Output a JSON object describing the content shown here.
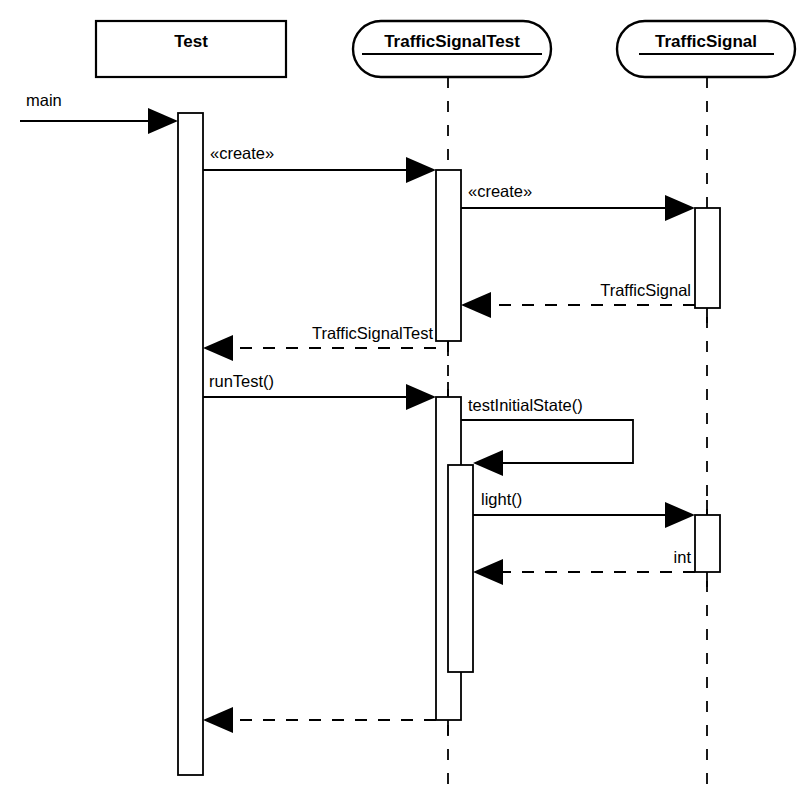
{
  "diagram": {
    "type": "uml-sequence-diagram",
    "title": "",
    "width": 809,
    "height": 796,
    "background_color": "#ffffff",
    "line_color": "#000000"
  },
  "participants": [
    {
      "id": "test",
      "label": "Test",
      "shape": "rectangle",
      "underlined": false,
      "box": {
        "x": 96,
        "y": 21,
        "w": 190,
        "h": 56
      },
      "lifeline_x": 190
    },
    {
      "id": "trafficsignaltest",
      "label": "TrafficSignalTest",
      "shape": "rounded-rectangle",
      "underlined": true,
      "box": {
        "x": 353,
        "y": 21,
        "w": 198,
        "h": 56
      },
      "lifeline_x": 448
    },
    {
      "id": "trafficsignal",
      "label": "TrafficSignal",
      "shape": "rounded-rectangle",
      "underlined": true,
      "box": {
        "x": 617,
        "y": 21,
        "w": 178,
        "h": 56
      },
      "lifeline_x": 707
    }
  ],
  "activations": [
    {
      "id": "act-test",
      "participant": "test",
      "x": 178,
      "y": 113,
      "w": 25,
      "h": 662
    },
    {
      "id": "act-tst-1",
      "participant": "trafficsignaltest",
      "x": 436,
      "y": 170,
      "w": 25,
      "h": 171
    },
    {
      "id": "act-ts-1",
      "participant": "trafficsignal",
      "x": 695,
      "y": 208,
      "w": 25,
      "h": 100
    },
    {
      "id": "act-tst-2",
      "participant": "trafficsignaltest",
      "x": 436,
      "y": 397,
      "w": 25,
      "h": 323
    },
    {
      "id": "act-tst-2-nested",
      "participant": "trafficsignaltest",
      "x": 448,
      "y": 465,
      "w": 25,
      "h": 207
    },
    {
      "id": "act-ts-2",
      "participant": "trafficsignal",
      "x": 695,
      "y": 515,
      "w": 25,
      "h": 57
    }
  ],
  "messages": [
    {
      "id": "msg-main",
      "label": "main",
      "kind": "found-call",
      "style": "solid",
      "from_x": 20,
      "to_x": 178,
      "y": 121,
      "label_x": 26,
      "label_y": 106,
      "label_align": "left"
    },
    {
      "id": "msg-create-1",
      "label": "«create»",
      "kind": "call",
      "style": "solid",
      "from_x": 203,
      "to_x": 436,
      "y": 170,
      "label_x": 210,
      "label_y": 159,
      "label_align": "left"
    },
    {
      "id": "msg-create-2",
      "label": "«create»",
      "kind": "call",
      "style": "solid",
      "from_x": 461,
      "to_x": 695,
      "y": 208,
      "label_x": 468,
      "label_y": 197,
      "label_align": "left"
    },
    {
      "id": "msg-return-trafficsignal",
      "label": "TrafficSignal",
      "kind": "return",
      "style": "dashed",
      "from_x": 695,
      "to_x": 461,
      "y": 305,
      "label_x": 691,
      "label_y": 296,
      "label_align": "right"
    },
    {
      "id": "msg-return-trafficsignaltest",
      "label": "TrafficSignalTest",
      "kind": "return",
      "style": "dashed",
      "from_x": 436,
      "to_x": 203,
      "y": 348,
      "label_x": 433,
      "label_y": 339,
      "label_align": "right"
    },
    {
      "id": "msg-runtest",
      "label": "runTest()",
      "kind": "call",
      "style": "solid",
      "from_x": 203,
      "to_x": 436,
      "y": 397,
      "label_x": 209,
      "label_y": 387,
      "label_align": "left"
    },
    {
      "id": "msg-light",
      "label": "light()",
      "kind": "call",
      "style": "solid",
      "from_x": 473,
      "to_x": 695,
      "y": 515,
      "label_x": 481,
      "label_y": 505,
      "label_align": "left"
    },
    {
      "id": "msg-return-int",
      "label": "int",
      "kind": "return",
      "style": "dashed",
      "from_x": 695,
      "to_x": 473,
      "y": 572,
      "label_x": 691,
      "label_y": 563,
      "label_align": "right"
    },
    {
      "id": "msg-return-final",
      "label": "",
      "kind": "return",
      "style": "dashed",
      "from_x": 436,
      "to_x": 203,
      "y": 720,
      "label_x": 433,
      "label_y": 711,
      "label_align": "right"
    }
  ],
  "self_messages": [
    {
      "id": "msg-testinitialstate",
      "label": "testInitialState()",
      "kind": "self-call",
      "style": "solid",
      "from_x": 461,
      "out_x": 633,
      "y_top": 420,
      "y_bottom": 463,
      "return_to_x": 473,
      "label_x": 468,
      "label_y": 411,
      "label_align": "left"
    }
  ]
}
